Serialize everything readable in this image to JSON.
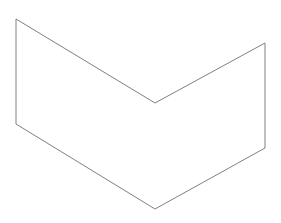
{
  "canvas": {
    "width": 281,
    "height": 223,
    "background": "#ffffff"
  },
  "shape": {
    "type": "chevron-polygon",
    "stroke": "#808080",
    "stroke_width": 1,
    "fill": "none",
    "points": [
      [
        16,
        19
      ],
      [
        155,
        103
      ],
      [
        265,
        43
      ],
      [
        265,
        148
      ],
      [
        155,
        209
      ],
      [
        16,
        124
      ]
    ]
  }
}
